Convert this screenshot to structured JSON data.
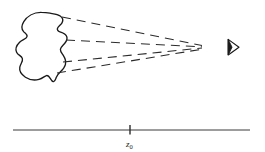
{
  "figure": {
    "background_color": "#ffffff",
    "ink_color": "#1a1a1a",
    "width": 265,
    "height": 152,
    "object": {
      "name": "irregular-blob-outline",
      "stroke_color": "#1a1a1a",
      "stroke_width": 1.3,
      "fill": "none",
      "bounds": {
        "x": 14,
        "y": 12,
        "width": 54,
        "height": 70
      }
    },
    "rays": {
      "name": "dashed-converging-rays",
      "count": 4,
      "stroke_color": "#2b2b2b",
      "stroke_width": 1.1,
      "dash_pattern": "9 6",
      "convergence_point": {
        "x": 202,
        "y": 47
      },
      "origins": [
        {
          "x": 62,
          "y": 17
        },
        {
          "x": 66,
          "y": 40
        },
        {
          "x": 63,
          "y": 62
        },
        {
          "x": 57,
          "y": 73
        }
      ]
    },
    "observer": {
      "name": "eye-observer-symbol",
      "glyph": "right-pointing-triangle-with-pupil",
      "x": 226,
      "y": 39,
      "width": 13,
      "height": 16,
      "stroke_color": "#1a1a1a"
    },
    "axis": {
      "name": "horizontal-axis-line",
      "stroke_color": "#3a3a3a",
      "stroke_width": 1,
      "x_start": 13,
      "x_end": 250,
      "y": 130,
      "tick": {
        "x": 130,
        "y_top": 125,
        "y_bottom": 134
      },
      "tick_label": {
        "symbol": "z",
        "subscript": "0",
        "full": "z0",
        "x": 130,
        "y": 146
      }
    }
  }
}
